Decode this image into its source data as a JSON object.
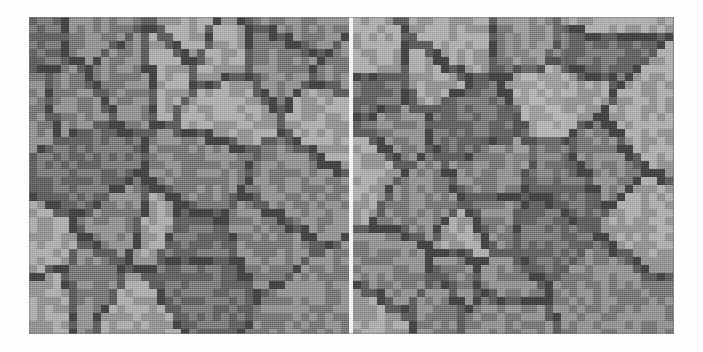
{
  "figure": {
    "title": "",
    "caption": "",
    "background_color": "#fdfdfd",
    "panel_count": 2,
    "divider_color": "#f2f2f2",
    "divider_width_px": 4,
    "image_region": {
      "x": 29,
      "y": 17,
      "width": 645,
      "height": 317
    }
  },
  "palette": {
    "boundary_dark": "#4f4f4f",
    "grain_mid": "#8a8a8a",
    "grain_light": "#a6a6a6",
    "grain_dark": "#717171",
    "page_white": "#fdfdfd",
    "divider_white": "#f2f2f2"
  },
  "panels": [
    {
      "name": "left-panel",
      "label": "",
      "cell_size_px": 8,
      "cols": 40,
      "rows": 40,
      "description": "pixelated polycrystalline grain structure, dark grain boundaries on mid-gray matrix"
    },
    {
      "name": "right-panel",
      "label": "",
      "cell_size_px": 8,
      "cols": 40,
      "rows": 40,
      "description": "pixelated polycrystalline grain structure with lighter illumination band upper-centre"
    }
  ],
  "chart_data": {
    "type": "heatmap",
    "title": "",
    "xlabel": "",
    "ylabel": "",
    "grid": false,
    "legend": "none",
    "cell_size_px": 8,
    "level_colors": [
      "#4f4f4f",
      "#717171",
      "#8a8a8a",
      "#a6a6a6"
    ],
    "level_names": [
      "boundary",
      "grain-dark",
      "grain-mid",
      "grain-light"
    ],
    "panels": [
      {
        "name": "left-panel",
        "cols": 40,
        "rows": 40,
        "values": [
          "2222222000222222222220002222222222200022",
          "2202200022222222222200002222222220022222",
          "0022222222222222222222222222222222222200",
          "2222222222222020002222222222222222222202",
          "0022222222220222222200222222222222222222",
          "2222222222202222222220022222222222222222",
          "2222222202222222222222022222222222200222",
          "2222222022222222222220222200022222202222",
          "0022222022222222222202222200222222202222",
          "2222220222222222222200222222022222202222",
          "2222220111111111122202222222022222200222",
          "2222220111111111122222222222022222222202",
          "2222220111111111100002222222022222222220",
          "2222220111111111111002222220222222222222",
          "0000000111111111111102222220222222222222",
          "2222222011111111111022222220222222222222",
          "2222222201111111110222222220222222222222",
          "2222222220000000000222222220222222222222",
          "2222222222222222222222222220000222222222",
          "0022222222222222222222222222220022222222",
          "2222222222222222222222222222222002222222",
          "2202222222222222222222222222222202222222",
          "2202222222222222222222222222222202222222",
          "2202222222222222222222222222222202222222",
          "2202222222222222222222222222222022222222",
          "2202222222222222222222222222220022222222",
          "2200222222222222222222222222200222222222",
          "2220022222222222222222222220022222222222",
          "2222002222222222222222222200222222222222",
          "2222200000002222222222222002222222222222",
          "2222222222220022222222200022222222222222",
          "2222222222222002222222002222222222222222",
          "2222222222222200000002222222222222222222",
          "2222222222222222222222222222222222222222",
          "0022222222222222222222222222222222222222",
          "2222222222222222222222222222222222222222",
          "2222222222222222222222222222222222222222",
          "2222222222222222222222222222222222222222",
          "2222222222222222222222222222222222222222",
          "2222222222222222222222222222222222222222"
        ]
      },
      {
        "name": "right-panel",
        "cols": 40,
        "rows": 40,
        "values": [
          "2222222222222222000222222222222222222222",
          "2222222222222222200022222222222222222222",
          "2222222222222222220002222222222222222222",
          "2222222222222222222002222222222222222222",
          "0000002222222222222002222222222222222222",
          "2222220222222222222002222222222222222222",
          "2222220222222000000002222222222222222222",
          "2222220000002222222222222222222222222222",
          "2222222222222222222222222222222222222222",
          "2222222222222222222222222222222222222222",
          "2222222222222222222222222222222222222222",
          "2222222222222222222222222222222222222222",
          "2222222222222222222222222222222222222222",
          "2222222222222222222222222222222222222222",
          "2222222222222222222222222222222222222222",
          "2222222222222222222222222222222222222222",
          "2222222222222222222222222222222222222222",
          "2222222222222222222222222222222222222222",
          "2222222222222222222222222222222222222222",
          "2222222222222222222222222222222222222222",
          "2222222222222222222222222222222222222222",
          "2222222222222222222222222222222222222222",
          "2222222222222222222222222222222222222222",
          "2222222222222222222222222222222222222222",
          "2222222222222222222222222222222222222222",
          "2222222222222222222222222222222222222222",
          "2222222222222222222222222222222222222222",
          "2222222222222222222222222222222222222222",
          "2222222222222222222222222222222222222222",
          "2222222222222222222222222222222222222222",
          "2222222222222222222222222222222222222222",
          "2222222222222222222222222222222222222222",
          "2222222222222222222222222222222222222222",
          "2222222222222222222222222222222222222222",
          "2222222222222222222222222222222222222222",
          "2222222222222222222222222222222222222222",
          "2222222222222222222222222222222222222222",
          "2222222222222222222222222222222222222222",
          "2222222222222222222222222222222222222222",
          "2222222222222222222222222222222222222222"
        ]
      }
    ]
  },
  "render_params": {
    "left_seed": 20147,
    "right_seed": 71532,
    "left_seed_count": 26,
    "right_seed_count": 27,
    "boundary_thickness_cells": 1,
    "noise_opacity": 0.3
  }
}
